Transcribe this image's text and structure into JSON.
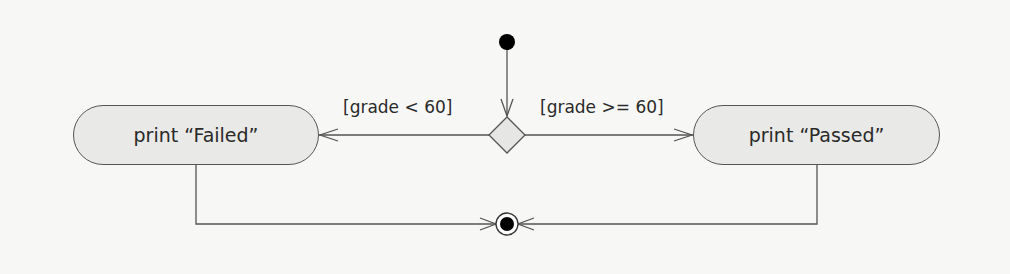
{
  "diagram": {
    "type": "UML activity diagram",
    "initial_node": "initial-state",
    "decision": {
      "shape": "diamond",
      "guards": {
        "left": "[grade < 60]",
        "right": "[grade >= 60]"
      }
    },
    "actions": {
      "failed": "print “Failed”",
      "passed": "print “Passed”"
    },
    "final_node": "final-state",
    "colors": {
      "background": "#f7f7f5",
      "stroke": "#555555",
      "fill": "#e9e9e7",
      "node": "#000000"
    }
  }
}
